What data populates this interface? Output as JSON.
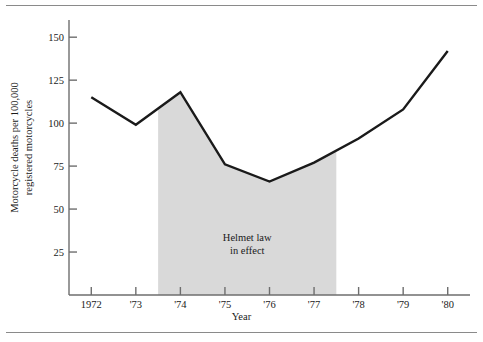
{
  "figure": {
    "background": "#ffffff",
    "rule_color": "#8a8a8a",
    "axis_color": "#6e6e6e",
    "line_color": "#1a1a1a",
    "band_color": "#d9d9d9"
  },
  "chart_data": {
    "type": "line",
    "title": "",
    "xlabel": "Year",
    "ylabel": "Motorcycle deaths per 100,000 registered motorcycles",
    "ylabel_line1": "Motorcycle deaths per 100,000",
    "ylabel_line2": "registered motorcycles",
    "categories": [
      "1972",
      "'73",
      "'74",
      "'75",
      "'76",
      "'77",
      "'78",
      "'79",
      "'80"
    ],
    "x": [
      1972,
      1973,
      1974,
      1975,
      1976,
      1977,
      1978,
      1979,
      1980
    ],
    "values": [
      115,
      99,
      118,
      76,
      66,
      77,
      91,
      108,
      142
    ],
    "ylim": [
      0,
      160
    ],
    "yticks": [
      25,
      50,
      75,
      100,
      125,
      150
    ],
    "ytick_labels": [
      "25",
      "50",
      "75",
      "100",
      "125",
      "150"
    ],
    "xlim": [
      1971.5,
      1980.5
    ],
    "grid": false,
    "legend": "none",
    "annotations": [
      {
        "name": "helmet-law-band",
        "line1": "Helmet law",
        "line2": "in effect",
        "text": "Helmet law in effect",
        "shaded_from": 1973.5,
        "shaded_to": 1977.5,
        "fill": "#d9d9d9"
      }
    ],
    "series": [
      {
        "name": "Motorcycle death rate",
        "values": [
          115,
          99,
          118,
          76,
          66,
          77,
          91,
          108,
          142
        ]
      }
    ]
  }
}
